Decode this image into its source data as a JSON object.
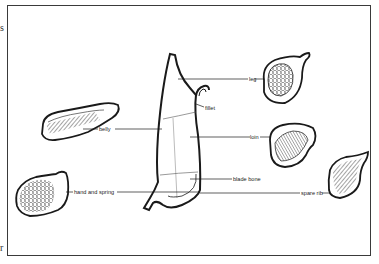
{
  "diagram": {
    "type": "pork-cuts-diagram",
    "colors": {
      "ink": "#1a1a1a",
      "frame": "#3a3a3a",
      "background": "#ffffff"
    },
    "edge_marks": {
      "top": "s",
      "bottom": "r"
    },
    "labels": {
      "leg": "leg",
      "fillet": "fillet",
      "belly": "belly",
      "loin": "loin",
      "blade_bone": "blade bone",
      "hand_and_spring": "hand and spring",
      "spare_rib": "spare rib"
    },
    "cuts": [
      {
        "name": "leg",
        "position": "top-right"
      },
      {
        "name": "belly",
        "position": "left"
      },
      {
        "name": "loin",
        "position": "right"
      },
      {
        "name": "hand and spring",
        "position": "bottom-left"
      },
      {
        "name": "spare rib",
        "position": "bottom-right"
      }
    ]
  }
}
